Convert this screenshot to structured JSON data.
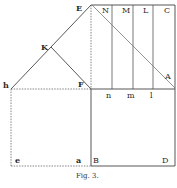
{
  "figure": {
    "caption": "Fig. 3.",
    "points": {
      "E": "E",
      "N": "N",
      "M": "M",
      "L": "L",
      "C": "C",
      "K": "K",
      "h": "h",
      "F": "F",
      "A": "A",
      "n": "n",
      "m": "m",
      "l": "l",
      "e": "e",
      "a": "a",
      "B": "B",
      "D": "D"
    },
    "colors": {
      "line": "#444444",
      "dashed": "#666666",
      "label": "#2a2a2a"
    }
  }
}
